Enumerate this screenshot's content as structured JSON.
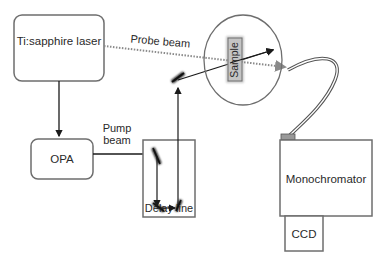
{
  "diagram": {
    "components": {
      "laser": {
        "label": "Ti:sapphire laser"
      },
      "opa": {
        "label": "OPA"
      },
      "delay_line": {
        "label": "Delay line"
      },
      "sample": {
        "label": "Sample"
      },
      "monochromator": {
        "label": "Monochromator"
      },
      "ccd": {
        "label": "CCD"
      }
    },
    "beams": {
      "probe": {
        "label": "Probe beam",
        "style": "dotted"
      },
      "pump": {
        "label_line1": "Pump",
        "label_line2": "beam",
        "style": "solid"
      }
    },
    "colors": {
      "box_stroke": "#6e6e6e",
      "beam": "#1a1a1a",
      "probe_dots": "#8a8a8a",
      "sample_fill": "#bdbdbd"
    }
  }
}
